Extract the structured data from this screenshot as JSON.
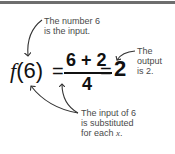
{
  "equation": {
    "function_name": "f",
    "argument": "(6)",
    "equals1": "=",
    "numerator": "6 + 2",
    "denominator": "4",
    "equals2": "=",
    "result": "2"
  },
  "annotations": {
    "input_line1": "The number 6",
    "input_line2": "is the input.",
    "output_line1": "The",
    "output_line2": "output",
    "output_line3": "is 2.",
    "subst_line1": "The input of 6",
    "subst_line2": "is substituted",
    "subst_line3_prefix": "for each ",
    "subst_line3_var": "x",
    "subst_line3_suffix": "."
  },
  "colors": {
    "text": "#111111",
    "annotation": "#4a4a4a",
    "topbar": "#6e6e6e"
  }
}
